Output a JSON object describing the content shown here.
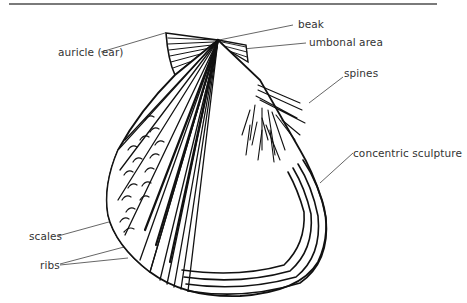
{
  "diagram": {
    "labels": {
      "auricle": "auricle (ear)",
      "beak": "beak",
      "umbonal_area": "umbonal area",
      "spines": "spines",
      "concentric_sculpture": "concentric sculpture",
      "scales": "scales",
      "ribs": "ribs"
    },
    "colors": {
      "ink": "#111111",
      "leader": "#555555",
      "label_text": "#333333",
      "rule": "#7a7a7a"
    }
  }
}
